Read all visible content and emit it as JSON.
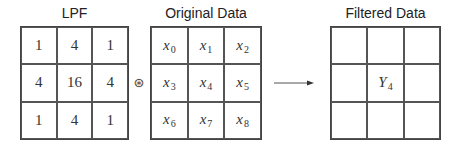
{
  "lpf": {
    "title": "LPF",
    "cells": [
      "1",
      "4",
      "1",
      "4",
      "16",
      "4",
      "1",
      "4",
      "1"
    ]
  },
  "operator": "⊛",
  "original": {
    "title": "Original Data",
    "cells": [
      {
        "base": "x",
        "sub": "0"
      },
      {
        "base": "x",
        "sub": "1"
      },
      {
        "base": "x",
        "sub": "2"
      },
      {
        "base": "x",
        "sub": "3"
      },
      {
        "base": "x",
        "sub": "4"
      },
      {
        "base": "x",
        "sub": "5"
      },
      {
        "base": "x",
        "sub": "6"
      },
      {
        "base": "x",
        "sub": "7"
      },
      {
        "base": "x",
        "sub": "8"
      }
    ]
  },
  "arrow": "right-arrow",
  "filtered": {
    "title": "Filtered Data",
    "center": {
      "base": "Y",
      "sub": "4"
    }
  }
}
